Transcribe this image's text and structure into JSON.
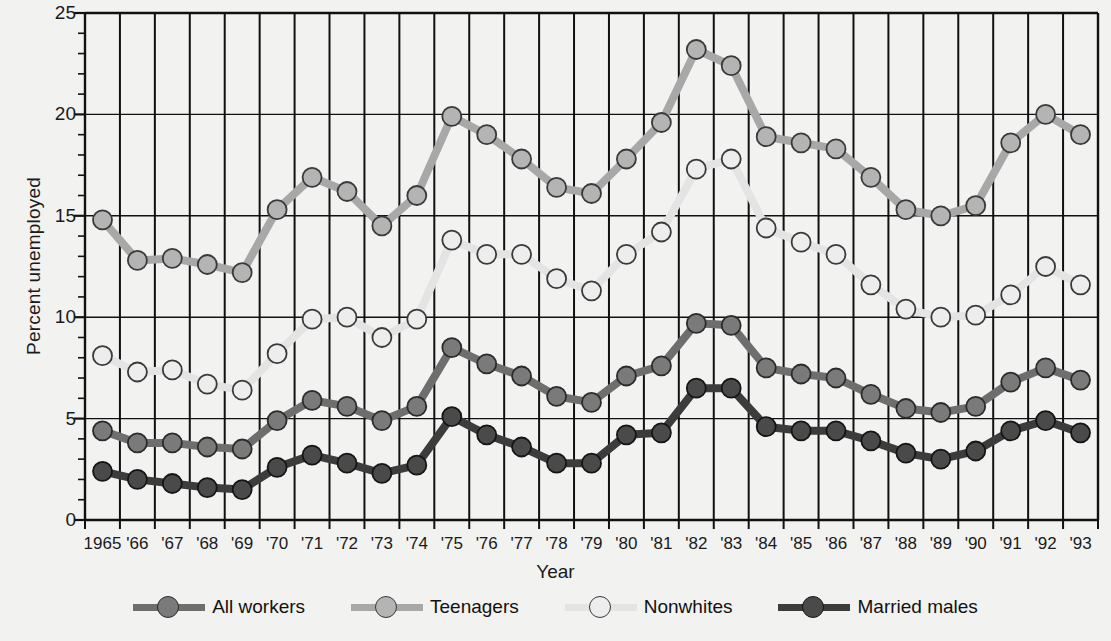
{
  "chart_data": {
    "type": "line",
    "title": "",
    "xlabel": "Year",
    "ylabel": "Percent unemployed",
    "ylim": [
      0,
      25
    ],
    "yticks": [
      0,
      5,
      10,
      15,
      20,
      25
    ],
    "y_minor_step": 1,
    "grid": "vertical lines at every year plus horizontal lines at 5,10,15,20",
    "legend_position": "bottom",
    "x": [
      1965,
      1966,
      1967,
      1968,
      1969,
      1970,
      1971,
      1972,
      1973,
      1974,
      1975,
      1976,
      1977,
      1978,
      1979,
      1980,
      1981,
      1982,
      1983,
      1984,
      1985,
      1986,
      1987,
      1988,
      1989,
      1990,
      1991,
      1992,
      1993
    ],
    "categories": [
      "1965",
      "'66",
      "'67",
      "'68",
      "'69",
      "'70",
      "'71",
      "'72",
      "'73",
      "'74",
      "'75",
      "'76",
      "'77",
      "'78",
      "'79",
      "'80",
      "'81",
      "'82",
      "'83",
      "'84",
      "'85",
      "'86",
      "'87",
      "'88",
      "'89",
      "'90",
      "'91",
      "'92",
      "'93"
    ],
    "series": [
      {
        "name": "Teenagers",
        "color": "#a8a8a8",
        "marker_fill": "#b4b4b4",
        "marker_stroke": "#3a3a3a",
        "values": [
          14.8,
          12.8,
          12.9,
          12.6,
          12.2,
          15.3,
          16.9,
          16.2,
          14.5,
          16.0,
          19.9,
          19.0,
          17.8,
          16.4,
          16.1,
          17.8,
          19.6,
          23.2,
          22.4,
          18.9,
          18.6,
          18.3,
          16.9,
          15.3,
          15.0,
          15.5,
          18.6,
          20.0,
          19.0
        ]
      },
      {
        "name": "Nonwhites",
        "color": "#e4e4e4",
        "marker_fill": "#ededed",
        "marker_stroke": "#3a3a3a",
        "values": [
          8.1,
          7.3,
          7.4,
          6.7,
          6.4,
          8.2,
          9.9,
          10.0,
          9.0,
          9.9,
          13.8,
          13.1,
          13.1,
          11.9,
          11.3,
          13.1,
          14.2,
          17.3,
          17.8,
          14.4,
          13.7,
          13.1,
          11.6,
          10.4,
          10.0,
          10.1,
          11.1,
          12.5,
          11.6
        ]
      },
      {
        "name": "All workers",
        "color": "#6e6e6e",
        "marker_fill": "#7a7a7a",
        "marker_stroke": "#2b2b2b",
        "values": [
          4.4,
          3.8,
          3.8,
          3.6,
          3.5,
          4.9,
          5.9,
          5.6,
          4.9,
          5.6,
          8.5,
          7.7,
          7.1,
          6.1,
          5.8,
          7.1,
          7.6,
          9.7,
          9.6,
          7.5,
          7.2,
          7.0,
          6.2,
          5.5,
          5.3,
          5.6,
          6.8,
          7.5,
          6.9
        ]
      },
      {
        "name": "Married males",
        "color": "#3c3c3c",
        "marker_fill": "#4a4a4a",
        "marker_stroke": "#151515",
        "values": [
          2.4,
          2.0,
          1.8,
          1.6,
          1.5,
          2.6,
          3.2,
          2.8,
          2.3,
          2.7,
          5.1,
          4.2,
          3.6,
          2.8,
          2.8,
          4.2,
          4.3,
          6.5,
          6.5,
          4.6,
          4.4,
          4.4,
          3.9,
          3.3,
          3.0,
          3.4,
          4.4,
          4.9,
          4.3
        ]
      }
    ]
  },
  "axis": {
    "y_label": "Percent unemployed",
    "x_label": "Year",
    "y_tick_labels": [
      "0",
      "5",
      "10",
      "15",
      "20",
      "25"
    ],
    "x_tick_labels": [
      "1965",
      "'66",
      "'67",
      "'68",
      "'69",
      "'70",
      "'71",
      "'72",
      "'73",
      "'74",
      "'75",
      "'76",
      "'77",
      "'78",
      "'79",
      "'80",
      "'81",
      "'82",
      "'83",
      "'84",
      "'85",
      "'86",
      "'87",
      "'88",
      "'89",
      "'90",
      "'91",
      "'92",
      "'93"
    ]
  },
  "legend": {
    "items": [
      {
        "label": "All workers",
        "line": "#6e6e6e",
        "fill": "#7a7a7a",
        "stroke": "#2b2b2b"
      },
      {
        "label": "Teenagers",
        "line": "#a8a8a8",
        "fill": "#b4b4b4",
        "stroke": "#3a3a3a"
      },
      {
        "label": "Nonwhites",
        "line": "#e4e4e4",
        "fill": "#ededed",
        "stroke": "#3a3a3a"
      },
      {
        "label": "Married males",
        "line": "#3c3c3c",
        "fill": "#4a4a4a",
        "stroke": "#151515"
      }
    ]
  },
  "colors": {
    "background": "#f2f2f0",
    "axis": "#111111",
    "gridline": "#111111"
  }
}
